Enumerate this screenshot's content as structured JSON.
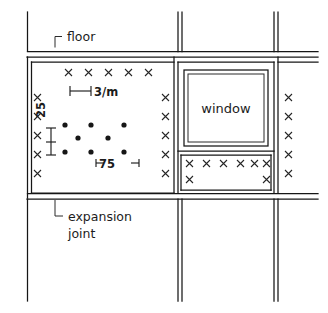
{
  "drawing": {
    "title": "Cladding panel fixing layout detail",
    "labels": {
      "floor": "floor",
      "expansion_joint_line1": "expansion",
      "expansion_joint_line2": "joint",
      "window": "window"
    },
    "dimensions": {
      "spacing_horizontal": "3/m",
      "spacing_vertical": "25",
      "spacing_dot": "75"
    },
    "colors": {
      "line": "#161616",
      "text": "#1c1c1c",
      "background": "#ffffff"
    },
    "markers": {
      "panel_top_x_count": 5,
      "panel_left_x_count": 5,
      "panel_right_x_count": 5,
      "far_right_x_count": 5,
      "sill_x_count": 6,
      "sill_lower_x_count": 2,
      "dot_rows": [
        3,
        2,
        3
      ]
    }
  }
}
